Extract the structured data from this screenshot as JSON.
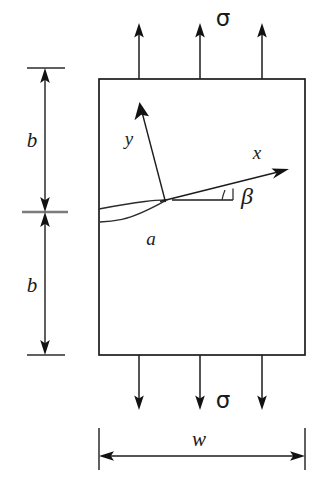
{
  "figure": {
    "type": "engineering-schematic",
    "background_color": "#ffffff",
    "line_color": "#1c1c1c",
    "canvas": {
      "width": 322,
      "height": 493
    }
  },
  "labels": {
    "stress_top": "σ",
    "stress_bottom": "σ",
    "height_upper": "b",
    "height_lower": "b",
    "width": "w",
    "crack_length": "a",
    "axis_x": "x",
    "axis_y": "y",
    "angle": "β"
  },
  "geometry": {
    "plate": {
      "left": 99,
      "top": 79,
      "right": 305,
      "bottom": 355
    },
    "crack_tip": {
      "x": 165,
      "y": 200
    },
    "crack_mouth": {
      "x": 99,
      "y": 214
    },
    "angle_beta_degrees": 11,
    "axis_x_tip": {
      "x": 287,
      "y": 167
    },
    "axis_y_tip": {
      "x": 140,
      "y": 104
    },
    "beta_reference_end": {
      "x": 232,
      "y": 200
    },
    "dimension_line_x": 45,
    "dimension_top_y": 68,
    "dimension_mid_y": 212,
    "dimension_bottom_y": 355,
    "width_dimension_y": 456
  },
  "load_arrows": {
    "top": {
      "direction": "up",
      "count": 3,
      "x_positions": [
        139,
        200,
        262
      ],
      "tail_y": 79,
      "head_y": 26
    },
    "bottom": {
      "direction": "down",
      "count": 3,
      "x_positions": [
        139,
        200,
        262
      ],
      "tail_y": 355,
      "head_y": 408
    }
  },
  "label_positions": {
    "stress_top": {
      "x": 223,
      "y": 19
    },
    "stress_bottom": {
      "x": 223,
      "y": 401
    },
    "height_upper": {
      "x": 32,
      "y": 142
    },
    "height_lower": {
      "x": 32,
      "y": 287
    },
    "width": {
      "x": 199,
      "y": 441
    },
    "crack_length": {
      "x": 151,
      "y": 241
    },
    "axis_x": {
      "x": 257,
      "y": 155
    },
    "axis_y": {
      "x": 129,
      "y": 141
    },
    "angle": {
      "x": 245,
      "y": 197
    }
  }
}
